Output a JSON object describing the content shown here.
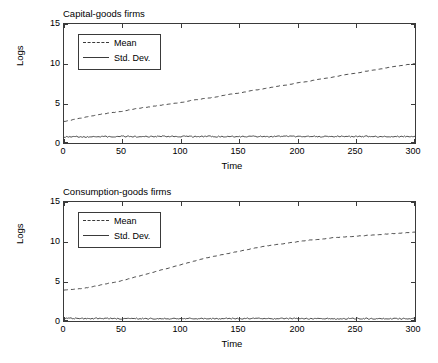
{
  "chart_data": [
    {
      "type": "line",
      "title": "Capital-goods firms",
      "xlabel": "Time",
      "ylabel": "Logs",
      "xlim": [
        0,
        300
      ],
      "ylim": [
        0,
        15
      ],
      "xticks": [
        0,
        50,
        100,
        150,
        200,
        250,
        300
      ],
      "yticks": [
        0,
        5,
        10,
        15
      ],
      "grid": false,
      "legend": {
        "position": "top-left",
        "entries": [
          {
            "label": "Mean",
            "style": "dashed"
          },
          {
            "label": "Std. Dev.",
            "style": "solid"
          }
        ]
      },
      "series": [
        {
          "name": "Mean",
          "style": "dashed",
          "x": [
            0,
            10,
            20,
            30,
            40,
            50,
            60,
            70,
            80,
            90,
            100,
            110,
            120,
            130,
            140,
            150,
            160,
            170,
            180,
            190,
            200,
            210,
            220,
            230,
            240,
            250,
            260,
            270,
            280,
            290,
            300
          ],
          "values": [
            2.7,
            3.0,
            3.3,
            3.6,
            3.8,
            4.0,
            4.3,
            4.5,
            4.7,
            4.9,
            5.1,
            5.4,
            5.6,
            5.8,
            6.1,
            6.3,
            6.6,
            6.8,
            7.1,
            7.3,
            7.6,
            7.8,
            8.1,
            8.3,
            8.6,
            8.8,
            9.1,
            9.3,
            9.6,
            9.8,
            10.0
          ]
        },
        {
          "name": "Std. Dev.",
          "style": "solid",
          "x": [
            0,
            10,
            20,
            30,
            40,
            50,
            60,
            70,
            80,
            90,
            100,
            110,
            120,
            130,
            140,
            150,
            160,
            170,
            180,
            190,
            200,
            210,
            220,
            230,
            240,
            250,
            260,
            270,
            280,
            290,
            300
          ],
          "values": [
            0.75,
            0.8,
            0.78,
            0.82,
            0.79,
            0.83,
            0.8,
            0.81,
            0.84,
            0.79,
            0.82,
            0.8,
            0.83,
            0.81,
            0.79,
            0.82,
            0.84,
            0.8,
            0.81,
            0.83,
            0.79,
            0.82,
            0.8,
            0.84,
            0.81,
            0.8,
            0.83,
            0.79,
            0.82,
            0.81,
            0.8
          ]
        }
      ]
    },
    {
      "type": "line",
      "title": "Consumption-goods firms",
      "xlabel": "Time",
      "ylabel": "Logs",
      "xlim": [
        0,
        300
      ],
      "ylim": [
        0,
        15
      ],
      "xticks": [
        0,
        50,
        100,
        150,
        200,
        250,
        300
      ],
      "yticks": [
        0,
        5,
        10,
        15
      ],
      "grid": false,
      "legend": {
        "position": "top-left",
        "entries": [
          {
            "label": "Mean",
            "style": "dashed"
          },
          {
            "label": "Std. Dev.",
            "style": "solid"
          }
        ]
      },
      "series": [
        {
          "name": "Mean",
          "style": "dashed",
          "x": [
            0,
            10,
            20,
            30,
            40,
            50,
            60,
            70,
            80,
            90,
            100,
            110,
            120,
            130,
            140,
            150,
            160,
            170,
            180,
            190,
            200,
            210,
            220,
            230,
            240,
            250,
            260,
            270,
            280,
            290,
            300
          ],
          "values": [
            3.9,
            4.0,
            4.2,
            4.5,
            4.8,
            5.1,
            5.5,
            5.9,
            6.3,
            6.7,
            7.1,
            7.5,
            7.9,
            8.2,
            8.5,
            8.8,
            9.1,
            9.4,
            9.6,
            9.8,
            10.0,
            10.2,
            10.3,
            10.5,
            10.6,
            10.7,
            10.8,
            10.9,
            11.0,
            11.1,
            11.2
          ]
        },
        {
          "name": "Std. Dev.",
          "style": "solid",
          "x": [
            0,
            10,
            20,
            30,
            40,
            50,
            60,
            70,
            80,
            90,
            100,
            110,
            120,
            130,
            140,
            150,
            160,
            170,
            180,
            190,
            200,
            210,
            220,
            230,
            240,
            250,
            260,
            270,
            280,
            290,
            300
          ],
          "values": [
            0.35,
            0.32,
            0.3,
            0.33,
            0.31,
            0.3,
            0.32,
            0.29,
            0.31,
            0.3,
            0.32,
            0.31,
            0.3,
            0.29,
            0.31,
            0.3,
            0.32,
            0.31,
            0.29,
            0.3,
            0.31,
            0.3,
            0.32,
            0.29,
            0.31,
            0.3,
            0.3,
            0.31,
            0.29,
            0.3,
            0.3
          ]
        }
      ]
    }
  ],
  "style": {
    "axis_color": "#3a3a3a",
    "line_color": "#3a3a3a",
    "background": "#ffffff"
  }
}
